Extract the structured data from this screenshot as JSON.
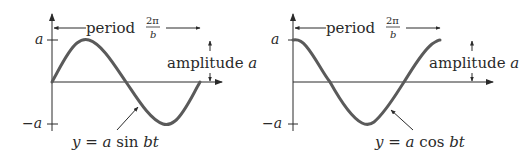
{
  "diagrams": [
    {
      "name": "sine",
      "period_label": "period",
      "period_num": "2π",
      "period_den": "b",
      "amplitude_label": "amplitude",
      "amplitude_var": "a",
      "tick_top": "a",
      "tick_bottom": "−a",
      "eq_y": "y",
      "eq_eq": " = ",
      "eq_a": "a",
      "eq_fn": " sin ",
      "eq_bt": "bt"
    },
    {
      "name": "cosine",
      "period_label": "period",
      "period_num": "2π",
      "period_den": "b",
      "amplitude_label": "amplitude",
      "amplitude_var": "a",
      "tick_top": "a",
      "tick_bottom": "−a",
      "eq_y": "y",
      "eq_eq": " = ",
      "eq_a": "a",
      "eq_fn": " cos ",
      "eq_bt": "bt"
    }
  ],
  "colors": {
    "curve": "#5a5a5a",
    "axis": "#2a2a2a"
  }
}
